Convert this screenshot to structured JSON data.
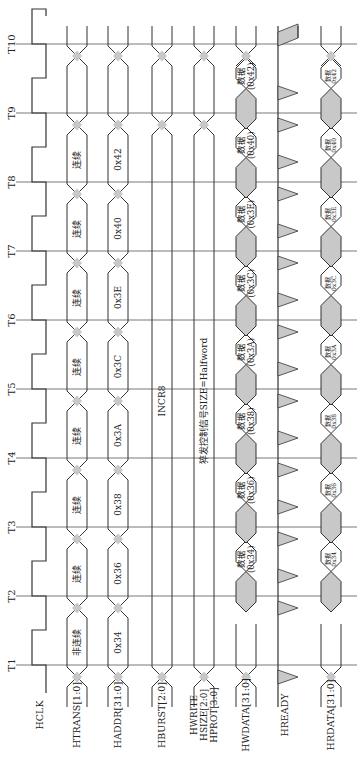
{
  "diagram": {
    "time_labels": [
      "T1",
      "T2",
      "T3",
      "T4",
      "T5",
      "T6",
      "T7",
      "T8",
      "T9",
      "T10"
    ],
    "signals": [
      {
        "id": "hclk",
        "label": "HCLK"
      },
      {
        "id": "htrans",
        "label": "HTRANS[1:0]"
      },
      {
        "id": "haddr",
        "label": "HADDR[31:0]"
      },
      {
        "id": "hburst",
        "label": "HBURST[2:0]"
      },
      {
        "id": "hctrl",
        "label": "HWRITE\nHSIZE[2:0]\nHPROT[3:0]",
        "lines": [
          "HWRITE",
          "HSIZE[2:0]",
          "HPROT[3:0]"
        ]
      },
      {
        "id": "hwdata",
        "label": "HWDATA[31:0]"
      },
      {
        "id": "hready",
        "label": "HREADY"
      },
      {
        "id": "hrdata",
        "label": "HRDATA[31:0]"
      }
    ],
    "htrans_values": [
      "非连续",
      "连续",
      "连续",
      "连续",
      "连续",
      "连续",
      "连续",
      "连续"
    ],
    "haddr_values": [
      "0x34",
      "0x36",
      "0x38",
      "0x3A",
      "0x3C",
      "0x3E",
      "0x40",
      "0x42"
    ],
    "hburst_value": "INCR8",
    "hctrl_value": "猝发控制信号SIZE=Halfword",
    "hwdata_values": [
      "数据\n(0x34)",
      "数据\n(0x36)",
      "数据\n(0x38)",
      "数据\n(0x3A)",
      "数据\n(0x3C)",
      "数据\n(0x3E)",
      "数据\n(0x40)",
      "数据\n(0x42)"
    ],
    "hrdata_values": [
      "数据\n(0x34)",
      "数据\n(0x36)",
      "数据\n(0x38)",
      "数据\n(0x3A)",
      "数据\n(0x3C)",
      "数据\n(0x3E)",
      "数据\n(0x40)",
      "数据\n(0x42)"
    ],
    "data_word": "数据",
    "hwdata_addr": [
      "(0x34)",
      "(0x36)",
      "(0x38)",
      "(0x3A)",
      "(0x3C)",
      "(0x3E)",
      "(0x40)",
      "(0x42)"
    ],
    "colors": {
      "line": "#333333",
      "fill": "#c8c8c8",
      "grid": "#555555"
    }
  }
}
